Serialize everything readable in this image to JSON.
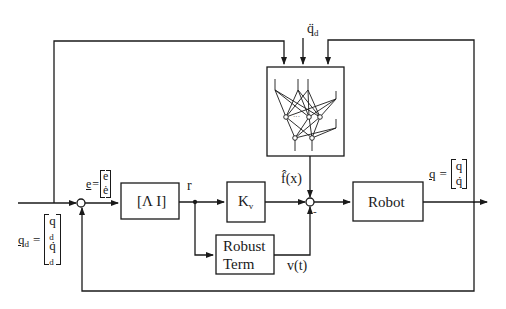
{
  "diagram": {
    "type": "block-diagram",
    "blocks": {
      "lambda_block": {
        "label": "[Λ  I]"
      },
      "kv_block": {
        "label": "K",
        "sub": "v"
      },
      "robot_block": {
        "label": "Robot"
      },
      "robust_block": {
        "line1": "Robust",
        "line2": "Term"
      },
      "nn_block": {
        "label": "neural network"
      }
    },
    "signals": {
      "qd_input": {
        "lhs": "q",
        "lhs_sub": "d",
        "eq": "=",
        "row1": "q",
        "row1_sub": "d",
        "row2": "q̇",
        "row2_sub": "d"
      },
      "error": {
        "lhs": "e",
        "eq": "=",
        "row1": "e",
        "row2": "ė"
      },
      "r": "r",
      "f_hat": "f̂(x)",
      "v_t": "v(t)",
      "qdd_d": {
        "base": "q̈",
        "sub": "d"
      },
      "output": {
        "lhs": "q",
        "eq": "=",
        "row1": "q",
        "row2": "q̇"
      },
      "minus_sign": "-"
    },
    "colors": {
      "line": "#1a1a1a",
      "background": "#ffffff"
    }
  }
}
